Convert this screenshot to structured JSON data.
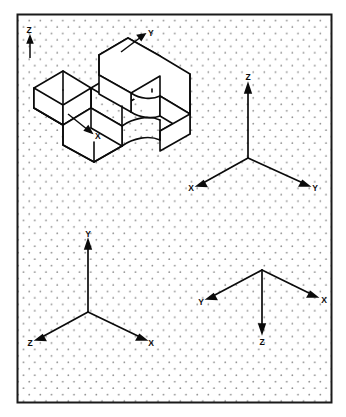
{
  "sheet": {
    "title": "Isometric Dot Grid Worksheet",
    "border_color": "#1a1a1a",
    "background_color": "#ffffff",
    "dot_color": "#8a8a8a",
    "line_color": "#0b0b0b",
    "border": {
      "x": 17,
      "y": 14,
      "width": 315,
      "height": 389
    },
    "grid": {
      "type": "isometric-dot",
      "h_spacing": 11.2,
      "v_spacing": 6.45,
      "dot_radius": 0.85
    }
  },
  "panels": [
    {
      "id": "pictorial-object",
      "name": "isometric-object",
      "description": "Isometric pictorial of a stepped block with a curved C-shaped slot",
      "axes": [
        {
          "label": "Z",
          "direction": "up",
          "label_x": 29,
          "label_y": 33
        },
        {
          "label": "Y",
          "direction": "upper-right",
          "label_x": 145,
          "label_y": 35
        },
        {
          "label": "X",
          "direction": "lower-right",
          "label_x": 95,
          "label_y": 136
        }
      ]
    },
    {
      "id": "triad-top-right",
      "name": "axis-triad-standard",
      "description": "Standard isometric triad: Z up, X lower-left, Y lower-right",
      "axes": [
        {
          "label": "Z",
          "direction": "up",
          "label_x": 247,
          "label_y": 77
        },
        {
          "label": "X",
          "direction": "lower-left",
          "label_x": 193,
          "label_y": 188
        },
        {
          "label": "Y",
          "direction": "lower-right",
          "label_x": 313,
          "label_y": 188
        }
      ]
    },
    {
      "id": "triad-bottom-left",
      "name": "axis-triad-y-up",
      "description": "Isometric triad: Y up, Z lower-left, X lower-right",
      "axes": [
        {
          "label": "Y",
          "direction": "up",
          "label_x": 88,
          "label_y": 234
        },
        {
          "label": "Z",
          "direction": "lower-left",
          "label_x": 29,
          "label_y": 344
        },
        {
          "label": "X",
          "direction": "lower-right",
          "label_x": 148,
          "label_y": 344
        }
      ]
    },
    {
      "id": "triad-bottom-right",
      "name": "axis-triad-inverted",
      "description": "Inverted isometric triad: Z down, Y upper-left, X upper-right",
      "axes": [
        {
          "label": "Z",
          "direction": "down",
          "label_x": 263,
          "label_y": 343
        },
        {
          "label": "Y",
          "direction": "upper-left",
          "label_x": 201,
          "label_y": 302
        },
        {
          "label": "X",
          "direction": "upper-right",
          "label_x": 325,
          "label_y": 300
        }
      ]
    }
  ],
  "labels": {
    "z": "Z",
    "y": "Y",
    "x": "X"
  }
}
